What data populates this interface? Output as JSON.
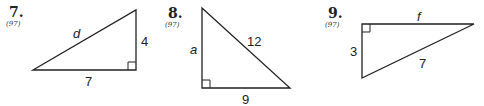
{
  "problems": [
    {
      "number": "7.",
      "reference": "(97)",
      "sides": {
        "hypotenuse": "d",
        "vertical_leg": "4",
        "horizontal_leg": "7"
      },
      "right_angle": "bottom-right"
    },
    {
      "number": "8.",
      "reference": "(97)",
      "sides": {
        "vertical_leg": "a",
        "hypotenuse": "12",
        "horizontal_leg": "9"
      },
      "right_angle": "bottom-left"
    },
    {
      "number": "9.",
      "reference": "(97)",
      "sides": {
        "horizontal_leg": "f",
        "vertical_leg": "3",
        "hypotenuse": "7"
      },
      "right_angle": "top-left"
    }
  ],
  "colors": {
    "stroke": "#222222",
    "background": "#ffffff"
  }
}
